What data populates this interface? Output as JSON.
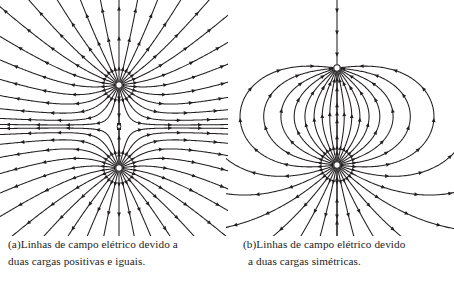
{
  "figure": {
    "background_color": "#ffffff",
    "line_color": "#231f20",
    "charge_marker_fill": "#ffffff",
    "charge_marker_stroke": "#231f20"
  },
  "panels": [
    {
      "id": "a",
      "name": "like-charges-field-diagram",
      "kind": "electric-field-lines",
      "configuration": "two-equal-positive-charges",
      "charges": [
        {
          "label": "top-charge",
          "sign": "+",
          "x": 119,
          "y": 85,
          "flow": "outward"
        },
        {
          "label": "bottom-charge",
          "sign": "+",
          "x": 119,
          "y": 168,
          "flow": "outward"
        }
      ],
      "null_point": {
        "x": 119,
        "y": 126.5
      },
      "lines_per_charge": 26,
      "caption": {
        "line1": "(a)Linhas de campo elétrico devido a",
        "line2": "duas cargas positivas e iguais."
      }
    },
    {
      "id": "b",
      "name": "opposite-charges-field-diagram",
      "kind": "electric-field-lines",
      "configuration": "two-symmetric-opposite-charges",
      "charges": [
        {
          "label": "top-charge",
          "sign": "-",
          "x": 111,
          "y": 68,
          "flow": "inward"
        },
        {
          "label": "bottom-charge",
          "sign": "+",
          "x": 111,
          "y": 165,
          "flow": "inward"
        }
      ],
      "dipole_arcs": 11,
      "caption": {
        "line1": "(b)Linhas de campo elétrico devido",
        "line2": "a duas cargas simétricas."
      }
    }
  ]
}
